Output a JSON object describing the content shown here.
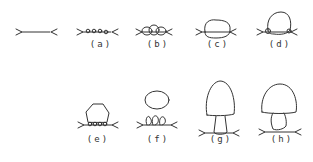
{
  "figure": {
    "panels": [
      {
        "id": "initial",
        "label": "",
        "description": "Plain chain strand with Y-shaped ends"
      },
      {
        "id": "a",
        "label": "(a)",
        "description": "Small beads along strand"
      },
      {
        "id": "b",
        "label": "(b)",
        "description": "Clustered overlapping loops"
      },
      {
        "id": "c",
        "label": "(c)",
        "description": "Single rounded body on strand"
      },
      {
        "id": "d",
        "label": "(d)",
        "description": "Larger body with small knots at base"
      },
      {
        "id": "e",
        "label": "(e)",
        "description": "Polygonal body atop beaded strand"
      },
      {
        "id": "f",
        "label": "(f)",
        "description": "Oval cap detached above leaf-like loops"
      },
      {
        "id": "g",
        "label": "(g)",
        "description": "Mushroom shape with long stem"
      },
      {
        "id": "h",
        "label": "(h)",
        "description": "Mushroom shape with irregular stem above strand"
      }
    ],
    "stroke_color": "#333333",
    "background": "#ffffff"
  }
}
